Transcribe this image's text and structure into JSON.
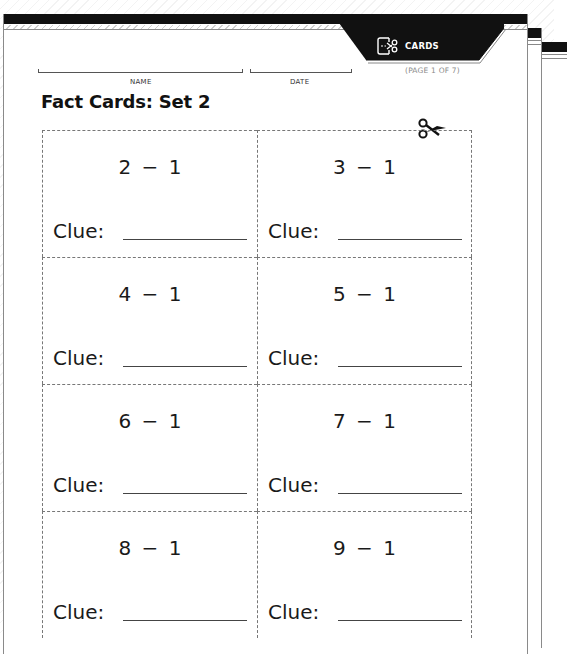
{
  "header": {
    "tab_label": "CARDS",
    "tab_icon": "cut-cards-icon",
    "page_indicator": "(PAGE 1 OF 7)"
  },
  "fields": {
    "name_label": "NAME",
    "date_label": "DATE"
  },
  "title": "Fact Cards: Set 2",
  "cut_icon": "scissors-icon",
  "cards": [
    {
      "expression": "2 − 1",
      "clue_label": "Clue:"
    },
    {
      "expression": "3 − 1",
      "clue_label": "Clue:"
    },
    {
      "expression": "4 − 1",
      "clue_label": "Clue:"
    },
    {
      "expression": "5 − 1",
      "clue_label": "Clue:"
    },
    {
      "expression": "6 − 1",
      "clue_label": "Clue:"
    },
    {
      "expression": "7 − 1",
      "clue_label": "Clue:"
    },
    {
      "expression": "8 − 1",
      "clue_label": "Clue:"
    },
    {
      "expression": "9 − 1",
      "clue_label": "Clue:"
    }
  ],
  "colors": {
    "band": "#111111",
    "dashed_border": "#777777",
    "page_indicator": "#8a8a8a"
  }
}
